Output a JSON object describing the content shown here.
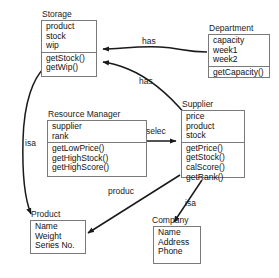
{
  "diagram": {
    "type": "uml-class-diagram",
    "classes": [
      {
        "id": "storage",
        "name": "Storage",
        "attributes": [
          "product",
          "stock",
          "wip"
        ],
        "operations": [
          "getStock()",
          "getWip()"
        ]
      },
      {
        "id": "department",
        "name": "Department",
        "attributes": [
          "capacity",
          "week1",
          "week2"
        ],
        "operations": [
          "getCapacity()"
        ]
      },
      {
        "id": "resource_manager",
        "name": "Resource Manager",
        "attributes": [
          "supplier",
          "rank"
        ],
        "operations": [
          "getLowPrice()",
          "getHighStock()",
          "getHighScore()"
        ]
      },
      {
        "id": "supplier",
        "name": "Supplier",
        "attributes": [
          "price",
          "product",
          "stock"
        ],
        "operations": [
          "getPrice()",
          "getStock()",
          "calScore()",
          "getRank()"
        ]
      },
      {
        "id": "product",
        "name": "Product",
        "attributes": [
          "Name",
          "Weight",
          "Series No."
        ],
        "operations": []
      },
      {
        "id": "company",
        "name": "Company",
        "attributes": [
          "Name",
          "Address",
          "Phone"
        ],
        "operations": []
      }
    ],
    "relationships": [
      {
        "id": "has_department_storage",
        "label": "has",
        "from": "department",
        "to": "storage"
      },
      {
        "id": "has_supplier_storage",
        "label": "has",
        "from": "supplier",
        "to": "storage"
      },
      {
        "id": "selec_rm_supplier",
        "label": "selec",
        "from": "resource_manager",
        "to": "supplier"
      },
      {
        "id": "isa_storage_product",
        "label": "isa",
        "from": "storage",
        "to": "product"
      },
      {
        "id": "produc_supplier_product",
        "label": "produc",
        "from": "supplier",
        "to": "product"
      },
      {
        "id": "isa_supplier_company",
        "label": "isa",
        "from": "supplier",
        "to": "company"
      }
    ],
    "colors": {
      "background": "#ffffff",
      "line": "#1a1a1a",
      "box_border": "#7a7a7a",
      "text": "#111111"
    }
  }
}
